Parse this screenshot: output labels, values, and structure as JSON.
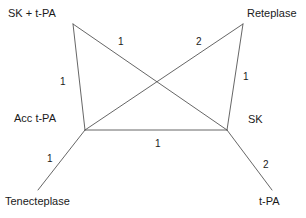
{
  "figure": {
    "type": "network-diagram",
    "background_color": "#ffffff",
    "line_color": "#555555",
    "text_color": "#1a1a1a"
  },
  "nodes": [
    {
      "id": "sk_tpa",
      "label": "SK + t-PA",
      "x": 73,
      "y": 24,
      "label_x": 8,
      "label_y": 8
    },
    {
      "id": "reteplase",
      "label": "Reteplase",
      "x": 243,
      "y": 24,
      "label_x": 247,
      "label_y": 8
    },
    {
      "id": "acc_tpa",
      "label": "Acc t-PA",
      "x": 85,
      "y": 130,
      "label_x": 14,
      "label_y": 113
    },
    {
      "id": "sk",
      "label": "SK",
      "x": 227,
      "y": 130,
      "label_x": 248,
      "label_y": 114
    },
    {
      "id": "tenecteplase",
      "label": "Tenecteplase",
      "x": 38,
      "y": 190,
      "label_x": 5,
      "label_y": 196
    },
    {
      "id": "tpa",
      "label": "t-PA",
      "x": 272,
      "y": 190,
      "label_x": 259,
      "label_y": 196
    }
  ],
  "edges": [
    {
      "from": "sk_tpa",
      "to": "acc_tpa",
      "weight": "1",
      "label_x": 60,
      "label_y": 77
    },
    {
      "from": "sk_tpa",
      "to": "sk",
      "weight": "1",
      "label_x": 118,
      "label_y": 37
    },
    {
      "from": "reteplase",
      "to": "acc_tpa",
      "weight": "2",
      "label_x": 196,
      "label_y": 37
    },
    {
      "from": "reteplase",
      "to": "sk",
      "weight": "1",
      "label_x": 243,
      "label_y": 72
    },
    {
      "from": "acc_tpa",
      "to": "sk",
      "weight": "1",
      "label_x": 155,
      "label_y": 139
    },
    {
      "from": "acc_tpa",
      "to": "tenecteplase",
      "weight": "1",
      "label_x": 47,
      "label_y": 154
    },
    {
      "from": "sk",
      "to": "tpa",
      "weight": "2",
      "label_x": 263,
      "label_y": 160
    }
  ],
  "chart_data": {
    "type": "network",
    "title": "",
    "nodes": [
      "SK + t-PA",
      "Reteplase",
      "Acc t-PA",
      "SK",
      "Tenecteplase",
      "t-PA"
    ],
    "edges": [
      {
        "source": "SK + t-PA",
        "target": "Acc t-PA",
        "value": 1
      },
      {
        "source": "SK + t-PA",
        "target": "SK",
        "value": 1
      },
      {
        "source": "Reteplase",
        "target": "Acc t-PA",
        "value": 2
      },
      {
        "source": "Reteplase",
        "target": "SK",
        "value": 1
      },
      {
        "source": "Acc t-PA",
        "target": "SK",
        "value": 1
      },
      {
        "source": "Acc t-PA",
        "target": "Tenecteplase",
        "value": 1
      },
      {
        "source": "SK",
        "target": "t-PA",
        "value": 2
      }
    ],
    "xlabel": "",
    "ylabel": "",
    "legend": []
  }
}
